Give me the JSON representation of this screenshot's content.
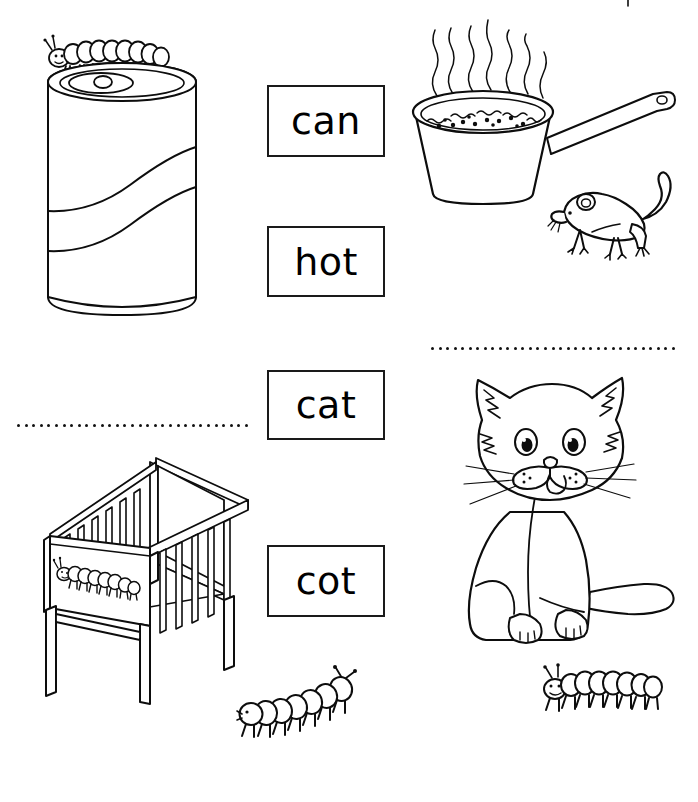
{
  "worksheet": {
    "type": "phonics-picture-word-matching",
    "background_color": "#ffffff",
    "ink_color": "#0d0d0d",
    "width": 698,
    "height": 802
  },
  "word_boxes": [
    {
      "id": "can",
      "label": "can",
      "x": 267,
      "y": 85,
      "w": 118,
      "h": 72
    },
    {
      "id": "hot",
      "label": "hot",
      "x": 267,
      "y": 226,
      "w": 118,
      "h": 71
    },
    {
      "id": "cat",
      "label": "cat",
      "x": 267,
      "y": 370,
      "w": 118,
      "h": 70
    },
    {
      "id": "cot",
      "label": "cot",
      "x": 267,
      "y": 545,
      "w": 118,
      "h": 72
    }
  ],
  "dotted_lines": [
    {
      "id": "left-writing-line",
      "x": 17,
      "y": 424,
      "w": 228,
      "dots": 31
    },
    {
      "id": "right-writing-line",
      "x": 431,
      "y": 347,
      "w": 241,
      "dots": 33
    }
  ],
  "illustrations": [
    {
      "id": "soda-can",
      "name": "soda can with caterpillar on top",
      "word": "can",
      "x": 30,
      "y": 25,
      "w": 180,
      "h": 300
    },
    {
      "id": "cooking-pot",
      "name": "steaming pot of food",
      "word": "hot",
      "x": 395,
      "y": 8,
      "w": 270,
      "h": 200
    },
    {
      "id": "mouse",
      "name": "mouse",
      "word": "",
      "x": 550,
      "y": 172,
      "w": 135,
      "h": 90
    },
    {
      "id": "cat",
      "name": "sitting cat",
      "word": "cat",
      "x": 440,
      "y": 362,
      "w": 240,
      "h": 290
    },
    {
      "id": "cot",
      "name": "baby cot crib with caterpillar",
      "word": "cot",
      "x": 30,
      "y": 448,
      "w": 220,
      "h": 240
    },
    {
      "id": "caterpillar-center",
      "name": "caterpillar",
      "word": "",
      "x": 238,
      "y": 658,
      "w": 128,
      "h": 78
    },
    {
      "id": "caterpillar-right",
      "name": "caterpillar",
      "word": "",
      "x": 538,
      "y": 660,
      "w": 128,
      "h": 60
    }
  ]
}
